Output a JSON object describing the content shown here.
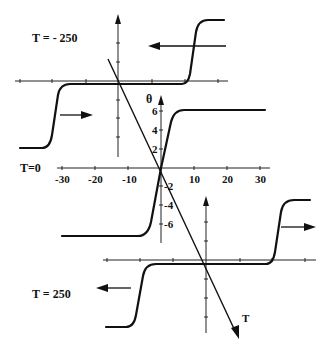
{
  "figure": {
    "colors": {
      "ink": "#111111",
      "background": "#ffffff"
    },
    "panels": [
      {
        "id": "top",
        "label": "T = - 250",
        "drive_direction": "left",
        "description": "Hysteresis-like step curve shifted right"
      },
      {
        "id": "middle",
        "label": "T=0",
        "description": "Symmetric step curve through origin"
      },
      {
        "id": "bottom",
        "label": "T = 250",
        "drive_direction": "right",
        "description": "Step curve shifted right"
      }
    ],
    "middle_axes": {
      "y_axis_label": "θ",
      "x_ticks": [
        "-30",
        "-20",
        "-10",
        "10",
        "20",
        "30"
      ],
      "y_ticks": [
        "6",
        "4",
        "2",
        "-2",
        "-4",
        "-6"
      ]
    },
    "t_axis_label": "T"
  }
}
